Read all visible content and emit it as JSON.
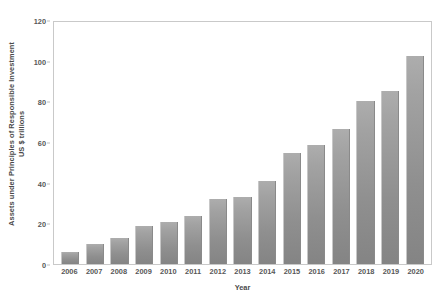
{
  "chart_data": {
    "type": "bar",
    "title": "",
    "xlabel": "Year",
    "ylabel": "Assets under Principles of Responsible Investment US $ trillions",
    "ylabel_line1": "Assets under Principles of Responsible Investment",
    "ylabel_line2": "US $ trillions",
    "categories": [
      "2006",
      "2007",
      "2008",
      "2009",
      "2010",
      "2011",
      "2012",
      "2013",
      "2014",
      "2015",
      "2016",
      "2017",
      "2018",
      "2019",
      "2020"
    ],
    "values": [
      6,
      10,
      13,
      19,
      21,
      24,
      32,
      33,
      41,
      55,
      59,
      67,
      81,
      86,
      103
    ],
    "ylim": [
      0,
      120
    ],
    "yticks": [
      0,
      20,
      40,
      60,
      80,
      100,
      120
    ],
    "ytick_labels": [
      "0",
      "20",
      "40",
      "60",
      "80",
      "100",
      "120"
    ],
    "grid": false,
    "legend": false,
    "bar_color": "#9b9b9b",
    "frame_color": "#c9c9c9",
    "text_color": "#4a4a4a"
  }
}
